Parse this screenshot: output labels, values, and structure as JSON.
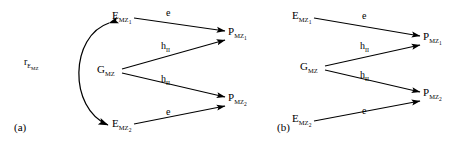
{
  "figure": {
    "type": "path-diagram",
    "background_color": "#ffffff",
    "stroke_color": "#000000",
    "panels": [
      {
        "id": "a",
        "caption": "(a)",
        "nodes": [
          {
            "id": "e-mz1",
            "base": "E",
            "sub": "MZ",
            "subsub": "1",
            "x": 112,
            "y": 16
          },
          {
            "id": "g-mz",
            "base": "G",
            "sub": "MZ",
            "subsub": "",
            "x": 97,
            "y": 70
          },
          {
            "id": "e-mz2",
            "base": "E",
            "sub": "MZ",
            "subsub": "2",
            "x": 112,
            "y": 124
          },
          {
            "id": "p-mz1",
            "base": "P",
            "sub": "MZ",
            "subsub": "1",
            "x": 228,
            "y": 32
          },
          {
            "id": "p-mz2",
            "base": "P",
            "sub": "MZ",
            "subsub": "2",
            "x": 228,
            "y": 98
          }
        ],
        "edges": [
          {
            "id": "e-mz1-to-p-mz1",
            "label": "e",
            "label_sub": "",
            "from": "e-mz1",
            "to": "p-mz1"
          },
          {
            "id": "g-mz-to-p-mz1",
            "label": "h",
            "label_sub": "II",
            "from": "g-mz",
            "to": "p-mz1"
          },
          {
            "id": "g-mz-to-p-mz2",
            "label": "h",
            "label_sub": "II",
            "from": "g-mz",
            "to": "p-mz2"
          },
          {
            "id": "e-mz2-to-p-mz2",
            "label": "e",
            "label_sub": "",
            "from": "e-mz2",
            "to": "p-mz2"
          }
        ],
        "correlation": {
          "id": "r-e-mz",
          "base": "r",
          "sub": "E",
          "subsub": "MZ",
          "between": [
            "e-mz1",
            "e-mz2"
          ]
        }
      },
      {
        "id": "b",
        "caption": "(b)",
        "nodes": [
          {
            "id": "e-mz1",
            "base": "E",
            "sub": "MZ",
            "subsub": "1",
            "x": 58,
            "y": 16
          },
          {
            "id": "g-mz",
            "base": "G",
            "sub": "MZ",
            "subsub": "",
            "x": 66,
            "y": 67
          },
          {
            "id": "e-mz2",
            "base": "E",
            "sub": "MZ",
            "subsub": "2",
            "x": 58,
            "y": 119
          },
          {
            "id": "p-mz1",
            "base": "P",
            "sub": "MZ",
            "subsub": "1",
            "x": 189,
            "y": 37
          },
          {
            "id": "p-mz2",
            "base": "P",
            "sub": "MZ",
            "subsub": "2",
            "x": 189,
            "y": 93
          }
        ],
        "edges": [
          {
            "id": "e-mz1-to-p-mz1",
            "label": "e",
            "label_sub": "",
            "from": "e-mz1",
            "to": "p-mz1"
          },
          {
            "id": "g-mz-to-p-mz1",
            "label": "h",
            "label_sub": "II",
            "from": "g-mz",
            "to": "p-mz1"
          },
          {
            "id": "g-mz-to-p-mz2",
            "label": "h",
            "label_sub": "II",
            "from": "g-mz",
            "to": "p-mz2"
          },
          {
            "id": "e-mz2-to-p-mz2",
            "label": "e",
            "label_sub": "",
            "from": "e-mz2",
            "to": "p-mz2"
          }
        ],
        "correlation": null
      }
    ]
  },
  "panel_a": {
    "caption": "(a)",
    "node_e_mz1_base": "E",
    "node_e_mz1_sub": "MZ",
    "node_e_mz1_subsub": "1",
    "node_g_mz_base": "G",
    "node_g_mz_sub": "MZ",
    "node_e_mz2_base": "E",
    "node_e_mz2_sub": "MZ",
    "node_e_mz2_subsub": "2",
    "node_p_mz1_base": "P",
    "node_p_mz1_sub": "MZ",
    "node_p_mz1_subsub": "1",
    "node_p_mz2_base": "P",
    "node_p_mz2_sub": "MZ",
    "node_p_mz2_subsub": "2",
    "edge_e_top": "e",
    "edge_h_upper_base": "h",
    "edge_h_upper_sub": "II",
    "edge_h_lower_base": "h",
    "edge_h_lower_sub": "II",
    "edge_e_bottom": "e",
    "corr_base": "r",
    "corr_sub": "E",
    "corr_subsub": "MZ"
  },
  "panel_b": {
    "caption": "(b)",
    "node_e_mz1_base": "E",
    "node_e_mz1_sub": "MZ",
    "node_e_mz1_subsub": "1",
    "node_g_mz_base": "G",
    "node_g_mz_sub": "MZ",
    "node_e_mz2_base": "E",
    "node_e_mz2_sub": "MZ",
    "node_e_mz2_subsub": "2",
    "node_p_mz1_base": "P",
    "node_p_mz1_sub": "MZ",
    "node_p_mz1_subsub": "1",
    "node_p_mz2_base": "P",
    "node_p_mz2_sub": "MZ",
    "node_p_mz2_subsub": "2",
    "edge_e_top": "e",
    "edge_h_upper_base": "h",
    "edge_h_upper_sub": "II",
    "edge_h_lower_base": "h",
    "edge_h_lower_sub": "II",
    "edge_e_bottom": "e"
  }
}
